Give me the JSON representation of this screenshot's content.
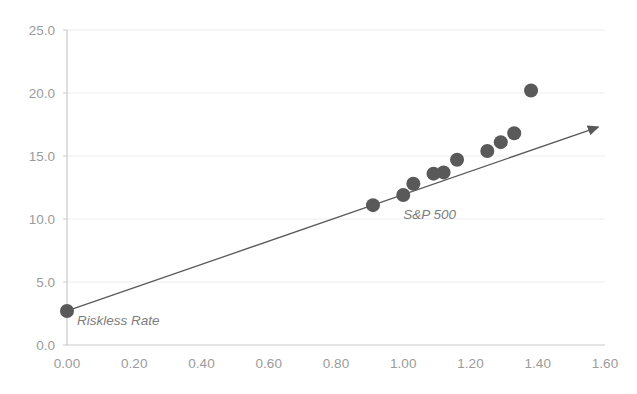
{
  "chart_data": {
    "type": "scatter",
    "title": "",
    "subtitle": "",
    "xlabel": "",
    "ylabel": "",
    "xlim": [
      0.0,
      1.6
    ],
    "ylim": [
      0.0,
      25.0
    ],
    "xticks": [
      "0.00",
      "0.20",
      "0.40",
      "0.60",
      "0.80",
      "1.00",
      "1.20",
      "1.40",
      "1.60"
    ],
    "xtick_values": [
      0.0,
      0.2,
      0.4,
      0.6,
      0.8,
      1.0,
      1.2,
      1.4,
      1.6
    ],
    "yticks": [
      "0.0",
      "5.0",
      "10.0",
      "15.0",
      "20.0",
      "25.0"
    ],
    "ytick_values": [
      0.0,
      5.0,
      10.0,
      15.0,
      20.0,
      25.0
    ],
    "grid": "horizontal",
    "legend": "none",
    "marker_color": "#595959",
    "line_color": "#595959",
    "grid_color": "#ededed",
    "axis_color": "#c9c9c9",
    "tick_label_color": "#9b9b9b",
    "annotation_color": "#7d7d7d",
    "series": [
      {
        "name": "Riskless Rate",
        "marker_size": 7,
        "points": [
          {
            "x": 0.0,
            "y": 2.7,
            "label": "Riskless Rate"
          }
        ]
      },
      {
        "name": "Assets",
        "marker_size": 7,
        "points": [
          {
            "x": 0.91,
            "y": 11.1,
            "label": ""
          },
          {
            "x": 1.0,
            "y": 11.9,
            "label": "S&P 500"
          },
          {
            "x": 1.03,
            "y": 12.8,
            "label": ""
          },
          {
            "x": 1.09,
            "y": 13.6,
            "label": ""
          },
          {
            "x": 1.12,
            "y": 13.7,
            "label": ""
          },
          {
            "x": 1.16,
            "y": 14.7,
            "label": ""
          },
          {
            "x": 1.25,
            "y": 15.4,
            "label": ""
          },
          {
            "x": 1.29,
            "y": 16.1,
            "label": ""
          },
          {
            "x": 1.33,
            "y": 16.8,
            "label": ""
          },
          {
            "x": 1.38,
            "y": 20.2,
            "label": ""
          }
        ]
      }
    ],
    "line": {
      "name": "Security Market Line",
      "from": {
        "x": 0.0,
        "y": 2.7
      },
      "to": {
        "x": 1.58,
        "y": 17.3
      },
      "arrow_head": true
    },
    "annotations": [
      {
        "name": "riskless-rate-label",
        "text": "Riskless Rate",
        "x": 0.03,
        "y": 1.55,
        "style": "italic"
      },
      {
        "name": "sp500-label",
        "text": "S&P 500",
        "x": 1.0,
        "y": 10.0,
        "style": "italic"
      }
    ]
  }
}
